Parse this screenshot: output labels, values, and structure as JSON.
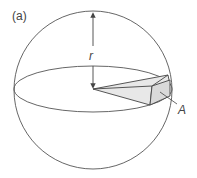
{
  "figure": {
    "panel_label": "(a)",
    "radius_label": "r",
    "area_label": "A",
    "colors": {
      "stroke": "#444444",
      "fill": "#e6e6e6",
      "background": "#ffffff"
    }
  }
}
